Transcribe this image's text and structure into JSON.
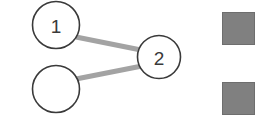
{
  "canvas": {
    "width": 278,
    "height": 132,
    "background": "#ffffff"
  },
  "style": {
    "node_fill": "#ffffff",
    "node_stroke": "#3a3a3a",
    "node_stroke_width": 1.6,
    "edge_color": "#a3a3a3",
    "edge_width": 5,
    "label_color": "#3a3a3a",
    "swatch_fill": "#808080",
    "swatch_stroke": "#6e6e6e"
  },
  "graph": {
    "nodes": [
      {
        "id": "node-1",
        "label": "1",
        "cx": 56,
        "cy": 25,
        "r": 23.5
      },
      {
        "id": "node-2",
        "label": "2",
        "cx": 159,
        "cy": 57,
        "r": 21.5
      },
      {
        "id": "node-3",
        "label": "",
        "cx": 56,
        "cy": 89,
        "r": 23.5
      }
    ],
    "edges": [
      {
        "id": "edge-1-2",
        "from": "node-1",
        "to": "node-2",
        "x1": 76,
        "y1": 37,
        "x2": 141,
        "y2": 50
      },
      {
        "id": "edge-3-2",
        "from": "node-3",
        "to": "node-2",
        "x1": 76,
        "y1": 79,
        "x2": 142,
        "y2": 66
      }
    ]
  },
  "swatches": [
    {
      "id": "swatch-top",
      "color": "#808080",
      "x": 222,
      "y": 12,
      "width": 33,
      "height": 33
    },
    {
      "id": "swatch-bottom",
      "color": "#808080",
      "x": 222,
      "y": 82,
      "width": 33,
      "height": 33
    }
  ]
}
